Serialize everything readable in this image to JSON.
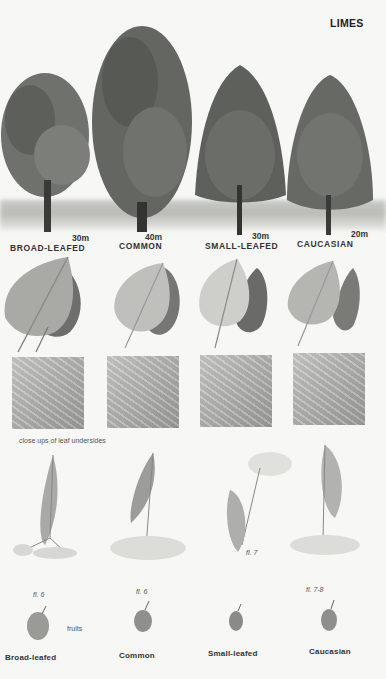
{
  "page": {
    "title": "LIMES",
    "trees": [
      {
        "name": "BROAD-LEAFED",
        "height": "30m"
      },
      {
        "name": "COMMON",
        "height": "40m"
      },
      {
        "name": "SMALL-LEAFED",
        "height": "30m"
      },
      {
        "name": "CAUCASIAN",
        "height": "20m"
      }
    ],
    "closeup_caption": "close ups of leaf undersides",
    "flowering": [
      {
        "label": "fl. 6"
      },
      {
        "label": "fl. 6"
      },
      {
        "label": "fl. 7"
      },
      {
        "label": "fl. 7-8"
      }
    ],
    "fruits_caption": "fruits",
    "species_names": [
      "Broad-leafed",
      "Common",
      "Small-leafed",
      "Caucasian"
    ],
    "colors": {
      "background": "#f7f7f5",
      "foliage": "#6f716d",
      "foliage_dark": "#4b4d49",
      "leaf_light": "#bdbdb9",
      "leaf_dark": "#707070",
      "text": "#2a2a2a"
    }
  }
}
